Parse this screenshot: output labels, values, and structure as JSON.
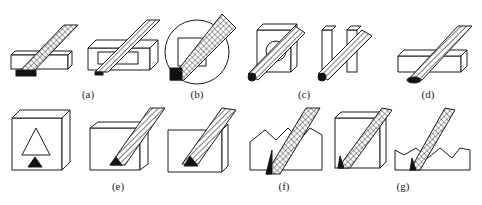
{
  "figure": {
    "panels": [
      {
        "id": "a",
        "label": "(a)",
        "description": "broach passing through a rectangular bar (flat surface)"
      },
      {
        "id": "b",
        "label": "(b)",
        "description": "broach through rectangular slot / keyway in a round part"
      },
      {
        "id": "c",
        "label": "(c)",
        "description": "round broach through square hole and slot"
      },
      {
        "id": "d",
        "label": "(d)",
        "description": "round broach across a bar"
      },
      {
        "id": "e",
        "label": "(e)",
        "description": "triangular and dovetail shaped profiles"
      },
      {
        "id": "f",
        "label": "(f)",
        "description": "toothed profile broaching"
      },
      {
        "id": "g",
        "label": "(g)",
        "description": "gear-tooth / serrated profile broaching"
      }
    ]
  },
  "colors": {
    "ink": "#1a1a1a",
    "background": "#ffffff"
  }
}
